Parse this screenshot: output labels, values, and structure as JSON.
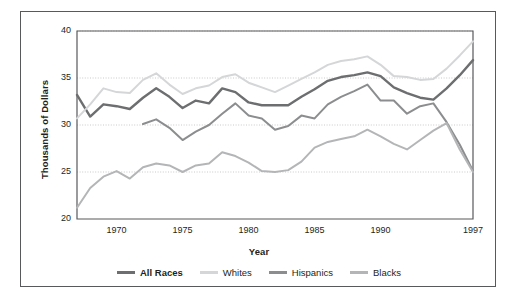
{
  "chart_data": {
    "type": "line",
    "title": "",
    "xlabel": "Year",
    "ylabel": "Thousands of Dollars",
    "xlim": [
      1967,
      1997
    ],
    "ylim": [
      20,
      40
    ],
    "yticks": [
      20,
      25,
      30,
      35,
      40
    ],
    "xticks": [
      1970,
      1975,
      1980,
      1985,
      1990,
      1997
    ],
    "grid": "horizontal-dotted",
    "legend_position": "bottom-center",
    "x": [
      1967,
      1968,
      1969,
      1970,
      1971,
      1972,
      1973,
      1974,
      1975,
      1976,
      1977,
      1978,
      1979,
      1980,
      1981,
      1982,
      1983,
      1984,
      1985,
      1986,
      1987,
      1988,
      1989,
      1990,
      1991,
      1992,
      1993,
      1994,
      1995,
      1996,
      1997
    ],
    "series": [
      {
        "name": "All Races",
        "color": "#6d6e70",
        "emphasis": "bold",
        "x": [
          1967,
          1968,
          1969,
          1970,
          1971,
          1972,
          1973,
          1974,
          1975,
          1976,
          1977,
          1978,
          1979,
          1980,
          1981,
          1982,
          1983,
          1984,
          1985,
          1986,
          1987,
          1988,
          1989,
          1990,
          1991,
          1992,
          1993,
          1994,
          1995,
          1996,
          1997
        ],
        "values": [
          33.2,
          30.9,
          32.2,
          32.0,
          31.7,
          32.9,
          33.9,
          33.0,
          31.8,
          32.6,
          32.3,
          33.9,
          33.5,
          32.4,
          32.1,
          32.1,
          32.1,
          33.0,
          33.8,
          34.7,
          35.1,
          35.3,
          35.6,
          35.2,
          34.0,
          33.4,
          32.9,
          32.7,
          33.9,
          35.3,
          36.9
        ],
        "units": "thousands of dollars"
      },
      {
        "name": "Whites",
        "color": "#d5d6d8",
        "emphasis": "normal",
        "x": [
          1967,
          1968,
          1969,
          1970,
          1971,
          1972,
          1973,
          1974,
          1975,
          1976,
          1977,
          1978,
          1979,
          1980,
          1981,
          1982,
          1983,
          1984,
          1985,
          1986,
          1987,
          1988,
          1989,
          1990,
          1991,
          1992,
          1993,
          1994,
          1995,
          1996,
          1997
        ],
        "values": [
          30.7,
          32.2,
          33.9,
          33.5,
          33.4,
          34.8,
          35.5,
          34.3,
          33.3,
          33.9,
          34.2,
          35.1,
          35.4,
          34.5,
          34.0,
          33.5,
          34.2,
          34.9,
          35.6,
          36.4,
          36.8,
          37.0,
          37.3,
          36.4,
          35.2,
          35.1,
          34.8,
          34.9,
          36.0,
          37.4,
          38.9
        ],
        "units": "thousands of dollars"
      },
      {
        "name": "Hispanics",
        "color": "#8c8d8f",
        "emphasis": "normal",
        "x": [
          1972,
          1973,
          1974,
          1975,
          1976,
          1977,
          1978,
          1979,
          1980,
          1981,
          1982,
          1983,
          1984,
          1985,
          1986,
          1987,
          1988,
          1989,
          1990,
          1991,
          1992,
          1993,
          1994,
          1995,
          1996,
          1997
        ],
        "values": [
          30.1,
          30.6,
          29.7,
          28.4,
          29.3,
          30.0,
          31.2,
          32.3,
          31.0,
          30.7,
          29.5,
          29.9,
          31.0,
          30.7,
          32.2,
          33.0,
          33.6,
          34.3,
          32.6,
          32.6,
          31.2,
          32.0,
          32.3,
          30.3,
          27.9,
          25.1
        ],
        "units": "thousands of dollars"
      },
      {
        "name": "Blacks",
        "color": "#b4b5b7",
        "emphasis": "normal",
        "x": [
          1967,
          1968,
          1969,
          1970,
          1971,
          1972,
          1973,
          1974,
          1975,
          1976,
          1977,
          1978,
          1979,
          1980,
          1981,
          1982,
          1983,
          1984,
          1985,
          1986,
          1987,
          1988,
          1989,
          1990,
          1991,
          1992,
          1993,
          1994,
          1995,
          1996,
          1997
        ],
        "values": [
          21.2,
          23.3,
          24.5,
          25.1,
          24.3,
          25.5,
          25.9,
          25.7,
          25.0,
          25.7,
          25.9,
          27.1,
          26.7,
          26.0,
          25.1,
          25.0,
          25.2,
          26.1,
          27.6,
          28.2,
          28.5,
          28.8,
          29.5,
          28.8,
          28.0,
          27.4,
          28.4,
          29.4,
          30.2,
          27.4,
          25.0
        ],
        "units": "thousands of dollars"
      }
    ]
  },
  "axes": {
    "ylabel": "Thousands of Dollars",
    "xlabel": "Year",
    "ytick_labels": [
      "40",
      "35",
      "30",
      "25",
      "20"
    ],
    "xtick_labels": [
      "1970",
      "1975",
      "1980",
      "1985",
      "1990",
      "1997"
    ]
  },
  "legend": {
    "items": [
      {
        "label": "All Races",
        "color": "#6d6e70",
        "bold": true
      },
      {
        "label": "Whites",
        "color": "#d5d6d8",
        "bold": false
      },
      {
        "label": "Hispanics",
        "color": "#8c8d8f",
        "bold": false
      },
      {
        "label": "Blacks",
        "color": "#b4b5b7",
        "bold": false
      }
    ]
  },
  "style": {
    "frame_color": "#58595b",
    "axis_color": "#58595b",
    "grid_color": "#bcbdbf",
    "background": "#ffffff"
  }
}
